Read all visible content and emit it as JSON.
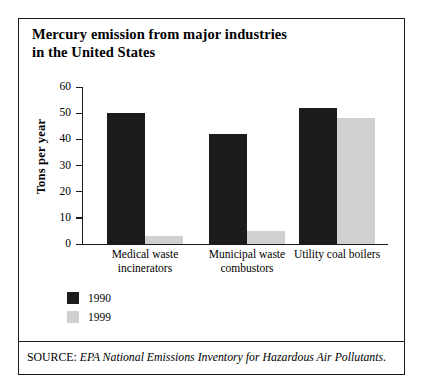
{
  "figure": {
    "title_line1": "Mercury emission from major industries",
    "title_line2": "in the United States",
    "source_prefix": "SOURCE:",
    "source_text": "EPA National Emissions Inventory for Hazardous Air Pollutants."
  },
  "colors": {
    "series_1990": "#1c1c1c",
    "series_1999": "#d0d0d0",
    "frame": "#1a1a1a",
    "background": "#ffffff"
  },
  "chart_data": {
    "type": "bar",
    "title": "Mercury emission from major industries in the United States",
    "xlabel": "",
    "ylabel": "Tons per year",
    "ylim": [
      0,
      60
    ],
    "yticks": [
      0,
      10,
      20,
      30,
      40,
      50,
      60
    ],
    "ytick_labels": [
      "0",
      "10",
      "20",
      "30",
      "40",
      "50",
      "60"
    ],
    "grid": false,
    "legend_position": "below-left",
    "categories": [
      "Medical waste incinerators",
      "Municipal waste combustors",
      "Utility coal boilers"
    ],
    "category_label_lines": [
      [
        "Medical waste",
        "incinerators"
      ],
      [
        "Municipal waste",
        "combustors"
      ],
      [
        "Utility coal boilers"
      ]
    ],
    "series": [
      {
        "name": "1990",
        "color": "#1c1c1c",
        "values": [
          50,
          42,
          52
        ]
      },
      {
        "name": "1999",
        "color": "#d0d0d0",
        "values": [
          3,
          5,
          48
        ]
      }
    ]
  }
}
